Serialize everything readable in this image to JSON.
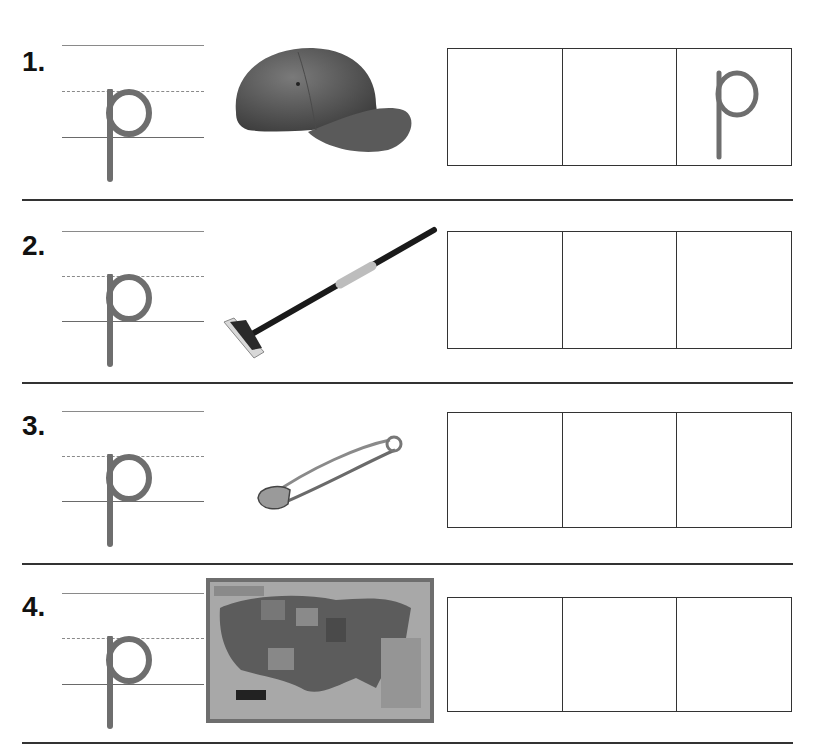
{
  "worksheet": {
    "letter": "p",
    "letter_color": "#6e6e6e",
    "items": [
      {
        "number": "1.",
        "picture": "baseball-cap",
        "boxes": [
          "",
          "",
          "p"
        ]
      },
      {
        "number": "2.",
        "picture": "mop",
        "boxes": [
          "",
          "",
          ""
        ]
      },
      {
        "number": "3.",
        "picture": "safety-pin",
        "boxes": [
          "",
          "",
          ""
        ]
      },
      {
        "number": "4.",
        "picture": "map",
        "boxes": [
          "",
          "",
          ""
        ]
      }
    ]
  }
}
